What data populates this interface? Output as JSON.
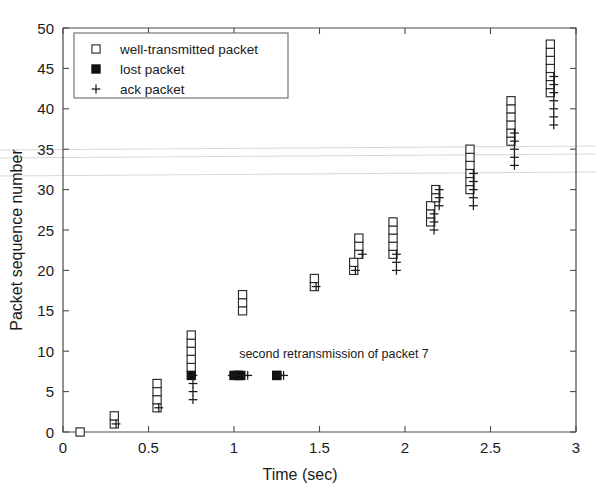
{
  "figure": {
    "background_color": "#ffffff",
    "ink_color": "#1a1a1a",
    "axis_color": "#4a4a4a"
  },
  "chart_data": {
    "type": "scatter",
    "title": "",
    "xlabel": "Time (sec)",
    "ylabel": "Packet sequence number",
    "xlim": [
      0,
      3
    ],
    "ylim": [
      0,
      50
    ],
    "xticks": [
      0,
      0.5,
      1,
      1.5,
      2,
      2.5,
      3
    ],
    "xticklabels": [
      "0",
      "0.5",
      "1",
      "1.5",
      "2",
      "2.5",
      "3"
    ],
    "yticks": [
      0,
      5,
      10,
      15,
      20,
      25,
      30,
      35,
      40,
      45,
      50
    ],
    "yticklabels": [
      "0",
      "5",
      "10",
      "15",
      "20",
      "25",
      "30",
      "35",
      "40",
      "45",
      "50"
    ],
    "grid": false,
    "legend_position": "upper left",
    "legend": [
      {
        "key": "well-transmitted",
        "marker": "open-square",
        "label": "well-transmitted packet"
      },
      {
        "key": "lost",
        "marker": "filled-square",
        "label": "lost packet"
      },
      {
        "key": "ack",
        "marker": "plus",
        "label": "ack packet"
      }
    ],
    "annotations": [
      {
        "text": "second retransmission of packet 7",
        "x": 1.03,
        "y": 9.1
      }
    ],
    "series": [
      {
        "name": "well-transmitted packet",
        "marker": "open-square",
        "points": [
          [
            0.1,
            0
          ],
          [
            0.3,
            1
          ],
          [
            0.3,
            2
          ],
          [
            0.55,
            3
          ],
          [
            0.55,
            4
          ],
          [
            0.55,
            5
          ],
          [
            0.55,
            6
          ],
          [
            0.75,
            8
          ],
          [
            0.75,
            9
          ],
          [
            0.75,
            10
          ],
          [
            0.75,
            11
          ],
          [
            0.75,
            12
          ],
          [
            1.03,
            7
          ],
          [
            1.05,
            15
          ],
          [
            1.05,
            16
          ],
          [
            1.05,
            17
          ],
          [
            1.25,
            7
          ],
          [
            1.47,
            18
          ],
          [
            1.47,
            19
          ],
          [
            1.7,
            20
          ],
          [
            1.7,
            21
          ],
          [
            1.73,
            22
          ],
          [
            1.73,
            23
          ],
          [
            1.73,
            24
          ],
          [
            1.93,
            22
          ],
          [
            1.93,
            23
          ],
          [
            1.93,
            24
          ],
          [
            1.93,
            25
          ],
          [
            1.93,
            26
          ],
          [
            2.15,
            26
          ],
          [
            2.15,
            27
          ],
          [
            2.15,
            28
          ],
          [
            2.18,
            29
          ],
          [
            2.18,
            30
          ],
          [
            2.38,
            30
          ],
          [
            2.38,
            31
          ],
          [
            2.38,
            32
          ],
          [
            2.38,
            33
          ],
          [
            2.38,
            34
          ],
          [
            2.38,
            35
          ],
          [
            2.62,
            36
          ],
          [
            2.62,
            37
          ],
          [
            2.62,
            38
          ],
          [
            2.62,
            39
          ],
          [
            2.62,
            40
          ],
          [
            2.62,
            41
          ],
          [
            2.85,
            42
          ],
          [
            2.85,
            43
          ],
          [
            2.85,
            44
          ],
          [
            2.85,
            45
          ],
          [
            2.85,
            46
          ],
          [
            2.85,
            47
          ],
          [
            2.85,
            48
          ]
        ]
      },
      {
        "name": "lost packet",
        "marker": "filled-square",
        "points": [
          [
            0.75,
            7
          ],
          [
            1.0,
            7
          ],
          [
            1.02,
            7
          ],
          [
            1.04,
            7
          ],
          [
            1.25,
            7
          ]
        ]
      },
      {
        "name": "ack packet",
        "marker": "plus",
        "points": [
          [
            0.31,
            1
          ],
          [
            0.56,
            3
          ],
          [
            0.76,
            4
          ],
          [
            0.76,
            5
          ],
          [
            0.76,
            6
          ],
          [
            0.76,
            7
          ],
          [
            0.99,
            7
          ],
          [
            1.01,
            7
          ],
          [
            1.06,
            7
          ],
          [
            1.08,
            7
          ],
          [
            1.27,
            7
          ],
          [
            1.29,
            7
          ],
          [
            1.48,
            18
          ],
          [
            1.71,
            20
          ],
          [
            1.75,
            22
          ],
          [
            1.95,
            20
          ],
          [
            1.95,
            21
          ],
          [
            1.95,
            22
          ],
          [
            2.17,
            25
          ],
          [
            2.17,
            26
          ],
          [
            2.17,
            27
          ],
          [
            2.2,
            28
          ],
          [
            2.2,
            29
          ],
          [
            2.2,
            30
          ],
          [
            2.4,
            28
          ],
          [
            2.4,
            29
          ],
          [
            2.4,
            30
          ],
          [
            2.4,
            31
          ],
          [
            2.4,
            32
          ],
          [
            2.64,
            33
          ],
          [
            2.64,
            34
          ],
          [
            2.64,
            35
          ],
          [
            2.64,
            36
          ],
          [
            2.64,
            37
          ],
          [
            2.87,
            38
          ],
          [
            2.87,
            39
          ],
          [
            2.87,
            40
          ],
          [
            2.87,
            41
          ],
          [
            2.87,
            42
          ],
          [
            2.87,
            43
          ],
          [
            2.87,
            44
          ]
        ]
      }
    ]
  }
}
